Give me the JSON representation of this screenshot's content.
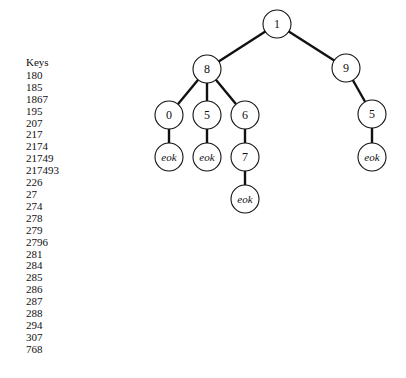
{
  "keys_panel": {
    "title": "Keys",
    "items": [
      "180",
      "185",
      "1867",
      "195",
      "207",
      "217",
      "2174",
      "21749",
      "217493",
      "226",
      "27",
      "274",
      "278",
      "279",
      "2796",
      "281",
      "284",
      "285",
      "286",
      "287",
      "288",
      "294",
      "307",
      "768"
    ]
  },
  "tree": {
    "nodes": {
      "root": "1",
      "n8": "8",
      "n9": "9",
      "n80": "0",
      "n85": "5",
      "n86": "6",
      "n95": "5",
      "n80_eok": "eok",
      "n85_eok": "eok",
      "n867": "7",
      "n867_eok": "eok",
      "n95_eok": "eok"
    }
  }
}
